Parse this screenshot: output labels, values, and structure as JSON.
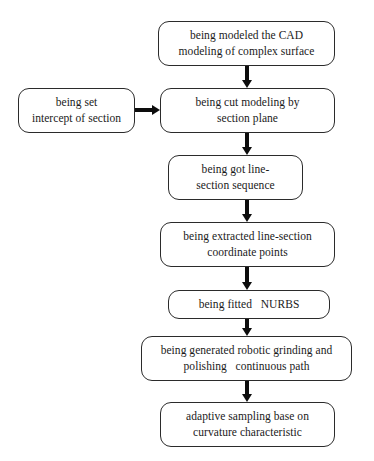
{
  "diagram": {
    "background_color": "#ffffff",
    "line_color": "#2b2b2b",
    "arrow_color": "#0d0d0d",
    "text_color": "#1a1a1a",
    "nodes": [
      {
        "id": "cad-modeling",
        "lines": [
          "being modeled the CAD",
          "modeling of complex surface"
        ],
        "x": 158,
        "y": 21,
        "w": 177,
        "h": 45
      },
      {
        "id": "set-intercept",
        "lines": [
          "being set",
          "intercept of section"
        ],
        "x": 18,
        "y": 88,
        "w": 117,
        "h": 45
      },
      {
        "id": "cut-modeling",
        "lines": [
          "being cut modeling by",
          "section plane"
        ],
        "x": 160,
        "y": 88,
        "w": 175,
        "h": 45
      },
      {
        "id": "line-section-sequence",
        "lines": [
          "being got line-",
          "section sequence"
        ],
        "x": 168,
        "y": 155,
        "w": 135,
        "h": 45
      },
      {
        "id": "extract-coordinate-points",
        "lines": [
          "being extracted line-section",
          "coordinate points"
        ],
        "x": 160,
        "y": 222,
        "w": 175,
        "h": 45
      },
      {
        "id": "fit-nurbs",
        "lines": [
          "being fitted   NURBS"
        ],
        "x": 168,
        "y": 290,
        "w": 162,
        "h": 29
      },
      {
        "id": "generate-path",
        "lines": [
          "being generated robotic grinding and",
          "polishing   continuous path"
        ],
        "x": 141,
        "y": 336,
        "w": 211,
        "h": 45
      },
      {
        "id": "adaptive-sampling",
        "lines": [
          "adaptive sampling base on",
          "curvature characteristic"
        ],
        "x": 160,
        "y": 402,
        "w": 175,
        "h": 45
      }
    ],
    "connectors": [
      {
        "id": "cad-to-cut",
        "orientation": "vertical",
        "x": 247,
        "y": 66,
        "length": 22
      },
      {
        "id": "intercept-to-cut",
        "orientation": "horizontal",
        "x": 135,
        "y": 110,
        "length": 25
      },
      {
        "id": "cut-to-sequence",
        "orientation": "vertical",
        "x": 247,
        "y": 133,
        "length": 22
      },
      {
        "id": "sequence-to-extract",
        "orientation": "vertical",
        "x": 247,
        "y": 200,
        "length": 22
      },
      {
        "id": "extract-to-nurbs",
        "orientation": "vertical",
        "x": 247,
        "y": 267,
        "length": 23
      },
      {
        "id": "nurbs-to-generate",
        "orientation": "vertical",
        "x": 247,
        "y": 319,
        "length": 17
      },
      {
        "id": "generate-to-sampling",
        "orientation": "vertical",
        "x": 247,
        "y": 381,
        "length": 21
      }
    ]
  }
}
